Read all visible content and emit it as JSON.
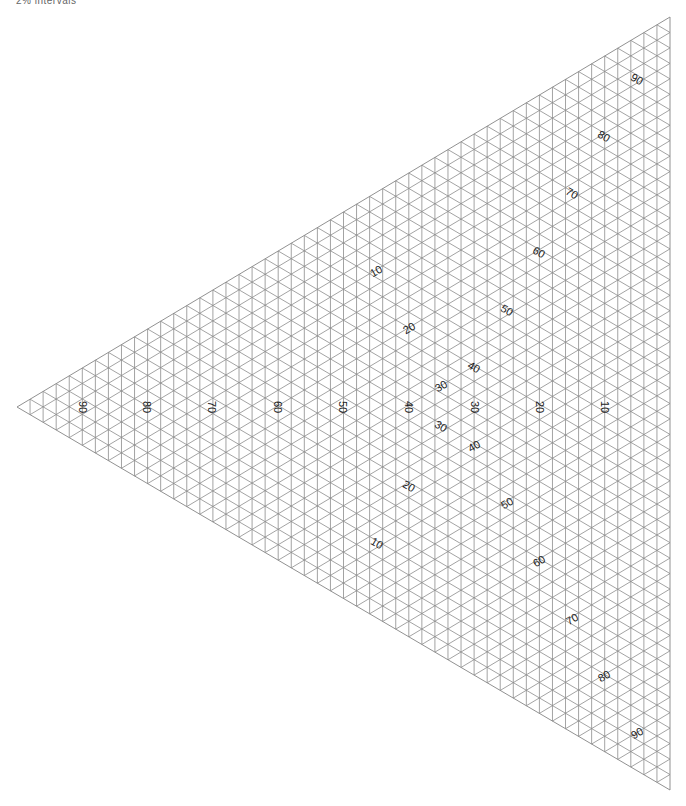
{
  "caption": "2% intervals",
  "triangle": {
    "vertices": {
      "left": [
        17,
        407
      ],
      "top": [
        670,
        17
      ],
      "bottom": [
        670,
        790
      ]
    },
    "divisions": 50,
    "line_color": "#8c8c8c",
    "line_width": 0.8
  },
  "labels": {
    "middle_axis": [
      {
        "text": "90",
        "x": 83,
        "y": 407
      },
      {
        "text": "80",
        "x": 147,
        "y": 407
      },
      {
        "text": "70",
        "x": 212,
        "y": 407
      },
      {
        "text": "60",
        "x": 278,
        "y": 407
      },
      {
        "text": "50",
        "x": 343,
        "y": 407
      },
      {
        "text": "40",
        "x": 409,
        "y": 407
      },
      {
        "text": "30",
        "x": 475,
        "y": 407
      },
      {
        "text": "20",
        "x": 540,
        "y": 407
      },
      {
        "text": "10",
        "x": 605,
        "y": 407
      }
    ],
    "upper_left_axis": [
      {
        "text": "10",
        "x": 376,
        "y": 271
      },
      {
        "text": "20",
        "x": 409,
        "y": 328
      },
      {
        "text": "30",
        "x": 441,
        "y": 386
      }
    ],
    "upper_right_axis": [
      {
        "text": "40",
        "x": 474,
        "y": 367
      },
      {
        "text": "50",
        "x": 507,
        "y": 310
      },
      {
        "text": "60",
        "x": 539,
        "y": 252
      },
      {
        "text": "70",
        "x": 572,
        "y": 193
      },
      {
        "text": "80",
        "x": 604,
        "y": 136
      },
      {
        "text": "90",
        "x": 637,
        "y": 79
      }
    ],
    "lower_left_axis": [
      {
        "text": "10",
        "x": 377,
        "y": 543
      },
      {
        "text": "20",
        "x": 409,
        "y": 486
      },
      {
        "text": "30",
        "x": 441,
        "y": 426
      }
    ],
    "lower_right_axis": [
      {
        "text": "40",
        "x": 474,
        "y": 446
      },
      {
        "text": "50",
        "x": 507,
        "y": 503
      },
      {
        "text": "60",
        "x": 539,
        "y": 561
      },
      {
        "text": "70",
        "x": 572,
        "y": 619
      },
      {
        "text": "80",
        "x": 604,
        "y": 676
      },
      {
        "text": "90",
        "x": 637,
        "y": 733
      }
    ]
  },
  "label_rotations": {
    "middle_axis": 90,
    "upper_left_axis": -30,
    "upper_right_axis": 30,
    "lower_left_axis": 30,
    "lower_right_axis": -30
  }
}
